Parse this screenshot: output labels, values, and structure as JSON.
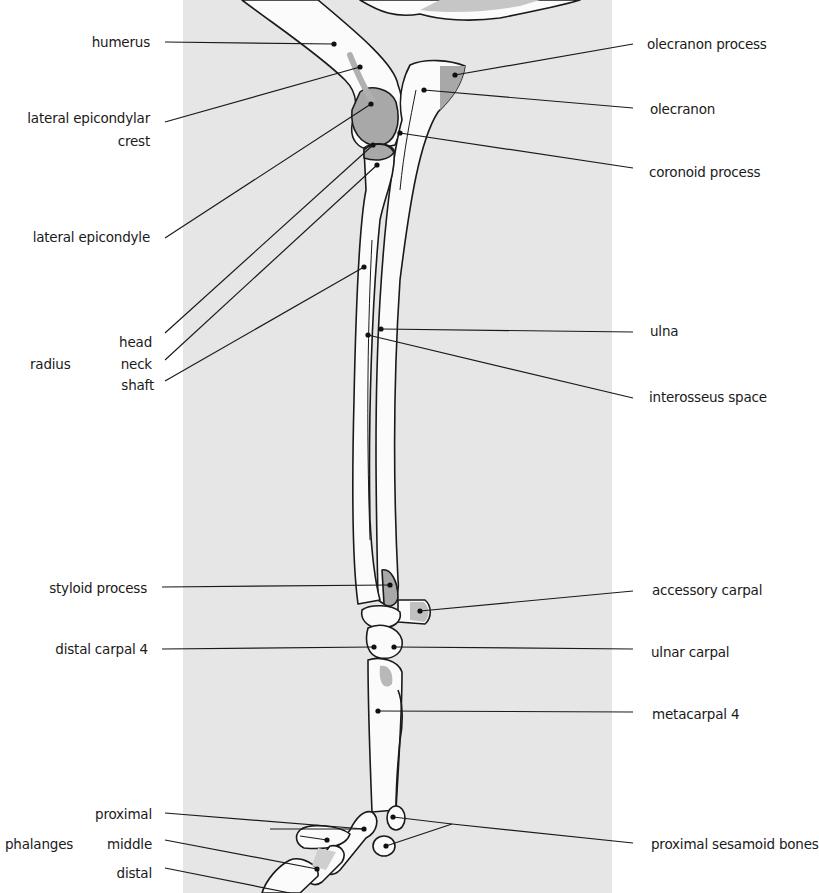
{
  "diagram": {
    "colors": {
      "background": "#ffffff",
      "panel": "#e6e6e6",
      "bone_fill": "#fbfbfb",
      "highlight_fill": "#a8a8a8",
      "outline": "#1a1a1a"
    }
  },
  "labels_left": {
    "humerus": "humerus",
    "lateral_epicondylar_crest_1": "lateral epicondylar",
    "lateral_epicondylar_crest_2": "crest",
    "lateral_epicondyle": "lateral epicondyle",
    "radius_group": "radius",
    "radius_head": "head",
    "radius_neck": "neck",
    "radius_shaft": "shaft",
    "styloid_process": "styloid process",
    "distal_carpal_4": "distal carpal 4",
    "phalanges_group": "phalanges",
    "phalanx_proximal": "proximal",
    "phalanx_middle": "middle",
    "phalanx_distal": "distal"
  },
  "labels_right": {
    "olecranon_process": "olecranon process",
    "olecranon": "olecranon",
    "coronoid_process": "coronoid process",
    "ulna": "ulna",
    "interosseus_space": "interosseus space",
    "accessory_carpal": "accessory carpal",
    "ulnar_carpal": "ulnar carpal",
    "metacarpal_4": "metacarpal 4",
    "proximal_sesamoid_bones": "proximal sesamoid bones"
  }
}
